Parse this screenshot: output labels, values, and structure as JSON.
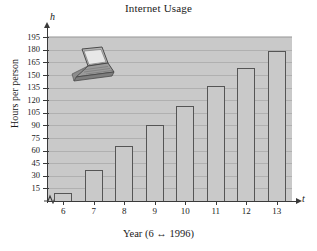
{
  "chart_data": {
    "type": "bar",
    "title": "Internet Usage",
    "xlabel": "Year (6 ↔ 1996)",
    "ylabel": "Hours per person",
    "x_axis_variable": "t",
    "y_axis_variable": "h",
    "categories": [
      "6",
      "7",
      "8",
      "9",
      "10",
      "11",
      "12",
      "13"
    ],
    "values": [
      9,
      37,
      65,
      91,
      113,
      137,
      158,
      178
    ],
    "ylim": [
      0,
      200
    ],
    "ytick_labels": [
      "15",
      "30",
      "45",
      "60",
      "75",
      "90",
      "105",
      "120",
      "135",
      "150",
      "165",
      "180",
      "195"
    ],
    "ytick_values": [
      15,
      30,
      45,
      60,
      75,
      90,
      105,
      120,
      135,
      150,
      165,
      180,
      195
    ],
    "grid": true,
    "legend": null,
    "axis_break": true,
    "plot_background_color": "#c9c9c9",
    "bar_fill_color": "#c9c9c9",
    "bar_edge_color": "#555555",
    "gridline_color": "#b0b0b0",
    "axis_color": "#3a3a3a",
    "decoration": "laptop-illustration"
  }
}
